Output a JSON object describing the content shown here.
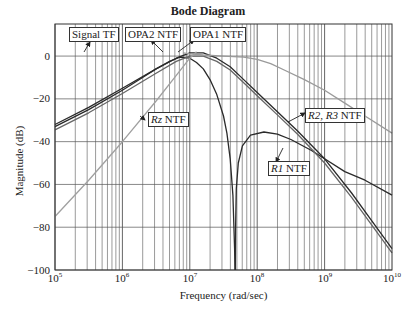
{
  "chart_data": {
    "type": "line",
    "title": "Bode Diagram",
    "xlabel": "Frequency  (rad/sec)",
    "ylabel": "Magnitude (dB)",
    "xscale": "log",
    "xlim": [
      100000,
      10000000000
    ],
    "ylim": [
      -100,
      15
    ],
    "grid": true,
    "xticks": [
      {
        "base": "10",
        "exp": "5"
      },
      {
        "base": "10",
        "exp": "6"
      },
      {
        "base": "10",
        "exp": "7"
      },
      {
        "base": "10",
        "exp": "8"
      },
      {
        "base": "10",
        "exp": "9"
      },
      {
        "base": "10",
        "exp": "10"
      }
    ],
    "yticks": [
      "0",
      "−20",
      "−40",
      "−60",
      "−80",
      "−100"
    ],
    "series": [
      {
        "name": "OPA2 NTF",
        "color": "#2a2a2a",
        "log_f": [
          5,
          5.5,
          6,
          6.3,
          6.5,
          6.7,
          6.85,
          7.0,
          7.1,
          7.2,
          7.3,
          7.4,
          7.5,
          7.55,
          7.6,
          7.64,
          7.665,
          7.67
        ],
        "db": [
          -33,
          -25,
          -16,
          -10,
          -6,
          -2.5,
          -0.5,
          -1,
          -3,
          -6,
          -11,
          -18,
          -28,
          -36,
          -48,
          -65,
          -90,
          -100
        ]
      },
      {
        "name": "R1 NTF",
        "color": "#2a2a2a",
        "log_f": [
          7.675,
          7.68,
          7.69,
          7.72,
          7.78,
          7.9,
          8.1,
          8.3,
          8.5,
          8.8,
          9.0,
          9.3,
          9.6,
          10
        ],
        "db": [
          -100,
          -80,
          -62,
          -50,
          -42,
          -37,
          -35.5,
          -36.5,
          -39,
          -44,
          -48,
          -54,
          -58,
          -65
        ]
      },
      {
        "name": "OPA1 NTF",
        "color": "#2a2a2a",
        "log_f": [
          5,
          5.5,
          6,
          6.5,
          6.8,
          7.0,
          7.2,
          7.4,
          7.6,
          7.8,
          8.0,
          8.3,
          8.6,
          9.0,
          9.4,
          9.7,
          10
        ],
        "db": [
          -32,
          -24,
          -15,
          -6,
          -1,
          1.5,
          1.5,
          -1,
          -5,
          -11,
          -17,
          -26,
          -35,
          -48,
          -64,
          -77,
          -90
        ]
      },
      {
        "name": "R2, R3 NTF",
        "color": "#666666",
        "log_f": [
          5,
          5.5,
          6,
          6.5,
          6.8,
          7.0,
          7.2,
          7.4,
          7.6,
          7.8,
          8.0,
          8.3,
          8.6,
          9.0,
          9.4,
          9.7,
          10
        ],
        "db": [
          -34.5,
          -26.5,
          -17.5,
          -8,
          -2.5,
          0,
          0,
          -2.5,
          -6.5,
          -12.5,
          -18.5,
          -27.5,
          -36.5,
          -50,
          -66,
          -79,
          -92
        ]
      },
      {
        "name": "Signal TF",
        "color": "#9a9a9a",
        "log_f": [
          6.9,
          7.0,
          7.2,
          7.5,
          7.8,
          8.0,
          8.2,
          8.4,
          8.7,
          9.0,
          9.3,
          9.6,
          10
        ],
        "db": [
          1.5,
          1,
          0.5,
          0,
          -0.5,
          -1.5,
          -3.5,
          -6.5,
          -11,
          -16,
          -22,
          -28,
          -36
        ]
      },
      {
        "name": "Rz NTF",
        "color": "#a0a0a0",
        "log_f": [
          5,
          5.5,
          6,
          6.5,
          6.8,
          7.0,
          7.1
        ],
        "db": [
          -75,
          -58,
          -40,
          -21,
          -9,
          -1,
          2
        ]
      }
    ]
  },
  "labels": {
    "signal_tf": "Signal TF",
    "opa2_ntf": "OPA2 NTF",
    "opa1_ntf": "OPA1 NTF",
    "rz_ntf_italic": "Rz",
    "rz_ntf_rest": " NTF",
    "r23_a": "R2",
    "r23_sep": ", ",
    "r23_b": "R3",
    "r23_rest": " NTF",
    "r1_a": "R1",
    "r1_rest": " NTF"
  }
}
